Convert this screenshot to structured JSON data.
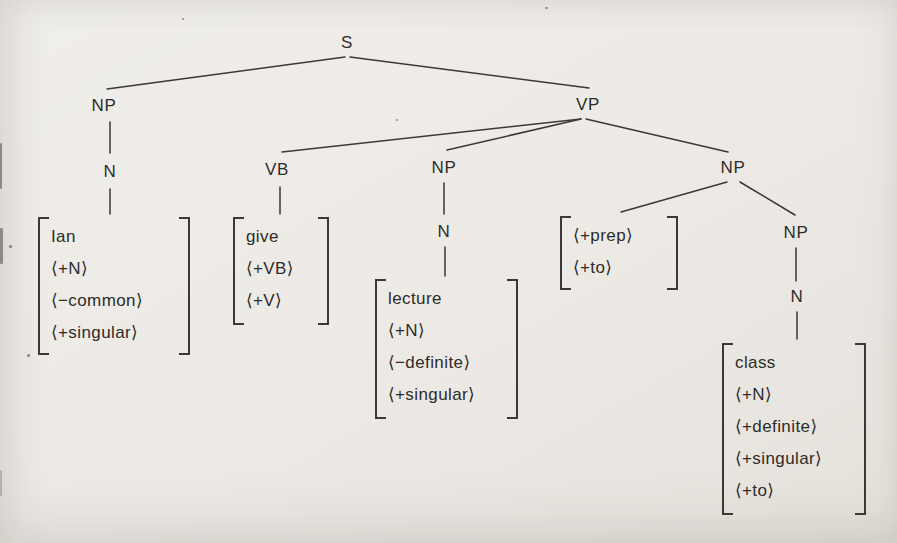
{
  "page": {
    "background": "#edeae6",
    "ink": "#3a3936",
    "text_color": "#2d2c2a"
  },
  "tree": {
    "nodes": [
      {
        "name": "node-s",
        "label": "S",
        "x": 347,
        "y": 43
      },
      {
        "name": "node-np-subject",
        "label": "NP",
        "x": 104,
        "y": 106
      },
      {
        "name": "node-vp",
        "label": "VP",
        "x": 588,
        "y": 105
      },
      {
        "name": "node-n-subject",
        "label": "N",
        "x": 110,
        "y": 172
      },
      {
        "name": "node-vb",
        "label": "VB",
        "x": 277,
        "y": 170
      },
      {
        "name": "node-np-direct-object",
        "label": "NP",
        "x": 444,
        "y": 168
      },
      {
        "name": "node-np-indirect",
        "label": "NP",
        "x": 733,
        "y": 168
      },
      {
        "name": "node-n-direct-object",
        "label": "N",
        "x": 444,
        "y": 232
      },
      {
        "name": "node-np-indirect-inner",
        "label": "NP",
        "x": 796,
        "y": 233
      },
      {
        "name": "node-n-indirect",
        "label": "N",
        "x": 797,
        "y": 297
      }
    ],
    "edges": [
      {
        "x1": 345,
        "y1": 57,
        "x2": 107,
        "y2": 89
      },
      {
        "x1": 350,
        "y1": 57,
        "x2": 589,
        "y2": 88
      },
      {
        "x1": 110,
        "y1": 122,
        "x2": 110,
        "y2": 153
      },
      {
        "x1": 110,
        "y1": 189,
        "x2": 110,
        "y2": 214
      },
      {
        "x1": 581,
        "y1": 119,
        "x2": 282,
        "y2": 152
      },
      {
        "x1": 581,
        "y1": 119,
        "x2": 447,
        "y2": 150
      },
      {
        "x1": 586,
        "y1": 119,
        "x2": 728,
        "y2": 152
      },
      {
        "x1": 280,
        "y1": 187,
        "x2": 280,
        "y2": 214
      },
      {
        "x1": 444,
        "y1": 183,
        "x2": 444,
        "y2": 214
      },
      {
        "x1": 445,
        "y1": 247,
        "x2": 445,
        "y2": 276
      },
      {
        "x1": 727,
        "y1": 182,
        "x2": 621,
        "y2": 212
      },
      {
        "x1": 740,
        "y1": 182,
        "x2": 795,
        "y2": 215
      },
      {
        "x1": 796,
        "y1": 248,
        "x2": 796,
        "y2": 281
      },
      {
        "x1": 797,
        "y1": 312,
        "x2": 797,
        "y2": 339
      }
    ],
    "matrices": [
      {
        "name": "matrix-ian",
        "x": 38,
        "y": 217,
        "w": 152,
        "h": 138,
        "rows": [
          "Ian",
          "⟨+N⟩",
          "⟨−common⟩",
          "⟨+singular⟩"
        ]
      },
      {
        "name": "matrix-give",
        "x": 233,
        "y": 217,
        "w": 96,
        "h": 108,
        "rows": [
          "give",
          "⟨+VB⟩",
          "⟨+V⟩"
        ]
      },
      {
        "name": "matrix-lecture",
        "x": 375,
        "y": 279,
        "w": 143,
        "h": 140,
        "rows": [
          "lecture",
          "⟨+N⟩",
          "⟨−definite⟩",
          "⟨+singular⟩"
        ]
      },
      {
        "name": "matrix-prep",
        "x": 560,
        "y": 216,
        "w": 118,
        "h": 74,
        "rows": [
          "⟨+prep⟩",
          "⟨+to⟩"
        ]
      },
      {
        "name": "matrix-class",
        "x": 722,
        "y": 343,
        "w": 144,
        "h": 172,
        "rows": [
          "class",
          "⟨+N⟩",
          "⟨+definite⟩",
          "⟨+singular⟩",
          "⟨+to⟩"
        ]
      }
    ]
  }
}
